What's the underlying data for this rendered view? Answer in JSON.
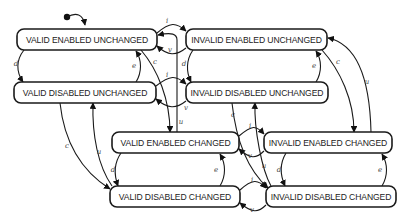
{
  "diagram": {
    "type": "state-machine",
    "initial_state": "VALID ENABLED UNCHANGED",
    "nodes": [
      {
        "id": "veu",
        "label": "VALID ENABLED UNCHANGED",
        "x": 17,
        "y": 29,
        "w": 140,
        "h": 21
      },
      {
        "id": "ieu",
        "label": "INVALID ENABLED UNCHANGED",
        "x": 186,
        "y": 29,
        "w": 141,
        "h": 21
      },
      {
        "id": "vdu",
        "label": "VALID DISABLED UNCHANGED",
        "x": 14,
        "y": 82,
        "w": 142,
        "h": 21
      },
      {
        "id": "idu",
        "label": "INVALID DISABLED UNCHANGED",
        "x": 186,
        "y": 82,
        "w": 142,
        "h": 21
      },
      {
        "id": "vec",
        "label": "VALID ENABLED CHANGED",
        "x": 112,
        "y": 132,
        "w": 127,
        "h": 21
      },
      {
        "id": "iec",
        "label": "INVALID ENABLED CHANGED",
        "x": 264,
        "y": 132,
        "w": 128,
        "h": 21
      },
      {
        "id": "vdc",
        "label": "VALID DISABLED CHANGED",
        "x": 110,
        "y": 186,
        "w": 130,
        "h": 21
      },
      {
        "id": "idc",
        "label": "INVALID DISABLED CHANGED",
        "x": 266,
        "y": 186,
        "w": 130,
        "h": 21
      }
    ],
    "edges": [
      {
        "from": "veu",
        "to": "ieu",
        "label": "i",
        "d": "M157,33 C170,22 176,22 186,31",
        "lx": 167,
        "ly": 21
      },
      {
        "from": "ieu",
        "to": "veu",
        "label": "v",
        "d": "M186,48 C176,56 168,56 157,46",
        "lx": 170,
        "ly": 50
      },
      {
        "from": "vdu",
        "to": "idu",
        "label": "i",
        "d": "M156,86 C170,75 176,75 186,84",
        "lx": 167,
        "ly": 75
      },
      {
        "from": "idu",
        "to": "vdu",
        "label": "v",
        "d": "M186,101 C176,109 168,109 156,99",
        "lx": 186,
        "ly": 108
      },
      {
        "from": "vec",
        "to": "iec",
        "label": "i",
        "d": "M239,136 C252,125 256,125 264,134",
        "lx": 250,
        "ly": 126
      },
      {
        "from": "iec",
        "to": "vec",
        "label": "v",
        "d": "M264,151 C256,159 250,159 239,149",
        "lx": 250,
        "ly": 156
      },
      {
        "from": "vdc",
        "to": "idc",
        "label": "i",
        "d": "M240,190 C252,179 258,179 266,188",
        "lx": 252,
        "ly": 180
      },
      {
        "from": "idc",
        "to": "vdc",
        "label": "v",
        "d": "M266,205 C258,213 252,213 240,203",
        "lx": 252,
        "ly": 210
      },
      {
        "from": "veu",
        "to": "vdu",
        "label": "d",
        "d": "M24,50 C16,60 16,72 23,82",
        "lx": 16,
        "ly": 64
      },
      {
        "from": "vdu",
        "to": "veu",
        "label": "e",
        "d": "M136,82 C142,72 142,60 136,51",
        "lx": 134,
        "ly": 66
      },
      {
        "from": "ieu",
        "to": "idu",
        "label": "d",
        "d": "M193,50 C186,60 186,72 191,82",
        "lx": 184,
        "ly": 64
      },
      {
        "from": "idu",
        "to": "ieu",
        "label": "e",
        "d": "M316,82 C322,72 322,60 316,51",
        "lx": 314,
        "ly": 66
      },
      {
        "from": "vec",
        "to": "vdc",
        "label": "d",
        "d": "M121,153 C114,163 114,175 118,186",
        "lx": 113,
        "ly": 170
      },
      {
        "from": "vdc",
        "to": "vec",
        "label": "e",
        "d": "M220,186 C226,176 226,164 220,154",
        "lx": 216,
        "ly": 170
      },
      {
        "from": "iec",
        "to": "idc",
        "label": "d",
        "d": "M286,153 C280,163 280,175 285,186",
        "lx": 279,
        "ly": 170
      },
      {
        "from": "idc",
        "to": "iec",
        "label": "e",
        "d": "M382,186 C388,176 388,164 382,154",
        "lx": 380,
        "ly": 170
      },
      {
        "from": "veu",
        "to": "vec",
        "label": "c",
        "d": "M141,50 C158,70 170,100 170,132",
        "lx": 155,
        "ly": 62
      },
      {
        "from": "vec",
        "to": "veu",
        "label": "u",
        "d": "M177,132 L177,40 C177,34 172,32 158,35",
        "lx": 181,
        "ly": 122
      },
      {
        "from": "ieu",
        "to": "iec",
        "label": "c",
        "d": "M322,50 C340,70 354,100 354,132",
        "lx": 338,
        "ly": 62
      },
      {
        "from": "iec",
        "to": "ieu",
        "label": "u",
        "d": "M371,132 C370,90 362,45 328,38",
        "lx": 367,
        "ly": 82
      },
      {
        "from": "vdu",
        "to": "vdc",
        "label": "c",
        "d": "M60,103 C64,140 80,170 110,189",
        "lx": 67,
        "ly": 146
      },
      {
        "from": "vdc",
        "to": "vdu",
        "label": "u",
        "d": "M112,186 C98,166 92,135 93,103",
        "lx": 99,
        "ly": 152
      },
      {
        "from": "idu",
        "to": "idc",
        "label": "c",
        "d": "M232,103 C236,140 248,170 268,188",
        "lx": 233,
        "ly": 115
      },
      {
        "from": "idc",
        "to": "idu",
        "label": "u",
        "d": "M271,186 C262,170 254,130 255,103",
        "lx": 264,
        "ly": 166
      }
    ],
    "initial": {
      "dot_x": 67,
      "dot_y": 17,
      "d": "M67,17 C76,12 83,14 85,25"
    }
  }
}
